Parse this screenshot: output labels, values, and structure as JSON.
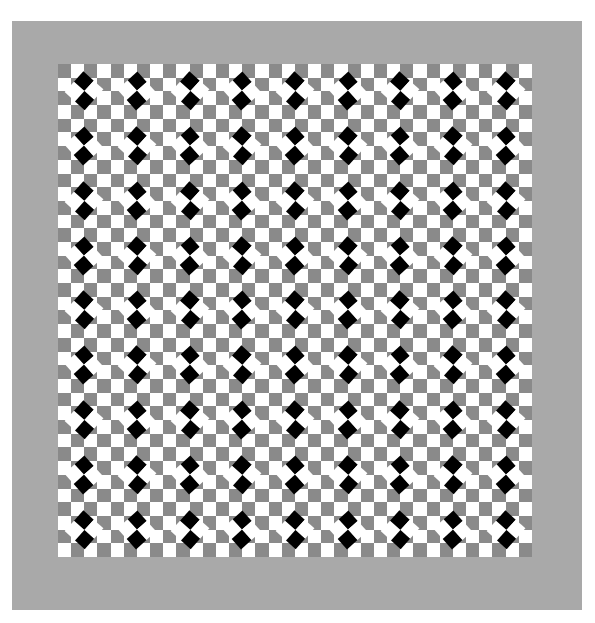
{
  "image": {
    "description": "Op-art optical illusion: 9x9 grid of tiles, each a gray/white checker background with a rotated 2x2 black/white checker diamond, tiles alternating orientation",
    "frame_color": "#a9a9a9",
    "background_gray": "#8a8a8a",
    "white": "#ffffff",
    "black": "#000000"
  },
  "grid": {
    "rows": 9,
    "cols": 9,
    "background_checker_per_tile": 4,
    "tile_types": [
      [
        "A",
        "B",
        "A",
        "B",
        "A",
        "B",
        "A",
        "B",
        "A"
      ],
      [
        "B",
        "A",
        "B",
        "A",
        "B",
        "A",
        "B",
        "A",
        "B"
      ],
      [
        "A",
        "B",
        "A",
        "B",
        "A",
        "B",
        "A",
        "B",
        "A"
      ],
      [
        "B",
        "A",
        "B",
        "A",
        "B",
        "A",
        "B",
        "A",
        "B"
      ],
      [
        "A",
        "B",
        "A",
        "B",
        "A",
        "B",
        "A",
        "B",
        "A"
      ],
      [
        "B",
        "A",
        "B",
        "A",
        "B",
        "A",
        "B",
        "A",
        "B"
      ],
      [
        "A",
        "B",
        "A",
        "B",
        "A",
        "B",
        "A",
        "B",
        "A"
      ],
      [
        "B",
        "A",
        "B",
        "A",
        "B",
        "A",
        "B",
        "A",
        "B"
      ],
      [
        "A",
        "B",
        "A",
        "B",
        "A",
        "B",
        "A",
        "B",
        "A"
      ]
    ],
    "tile_legend": {
      "A": "black squares left and right, white top and bottom",
      "B": "black squares top and bottom, white left and right"
    }
  }
}
